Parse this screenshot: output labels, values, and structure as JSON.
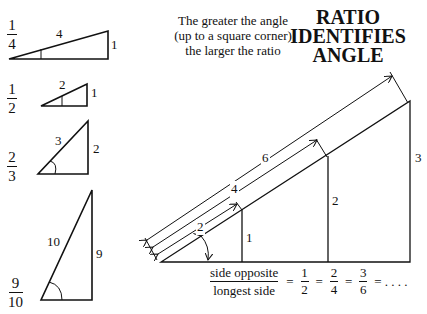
{
  "title": {
    "lines": [
      "RATIO",
      "IDENTIFIES",
      "ANGLE"
    ]
  },
  "caption": {
    "lines": [
      "The greater the angle",
      "(up to a square corner)",
      "the larger the ratio"
    ]
  },
  "small_triangles": [
    {
      "ratio_num": "1",
      "ratio_den": "4",
      "hyp": "4",
      "opp": "1"
    },
    {
      "ratio_num": "1",
      "ratio_den": "2",
      "hyp": "2",
      "opp": "1"
    },
    {
      "ratio_num": "2",
      "ratio_den": "3",
      "hyp": "3",
      "opp": "2"
    },
    {
      "ratio_num": "9",
      "ratio_den": "10",
      "hyp": "10",
      "opp": "9"
    }
  ],
  "big_triangle": {
    "hyp_labels": [
      "2",
      "4",
      "6"
    ],
    "opp_labels": [
      "1",
      "2",
      "3"
    ]
  },
  "equation": {
    "numerator": "side opposite",
    "denominator": "longest side",
    "equals": "=",
    "fractions": [
      {
        "num": "1",
        "den": "2"
      },
      {
        "num": "2",
        "den": "4"
      },
      {
        "num": "3",
        "den": "6"
      }
    ],
    "ellipsis": "= . . . ."
  },
  "colors": {
    "ink": "#111111",
    "background": "#ffffff"
  }
}
